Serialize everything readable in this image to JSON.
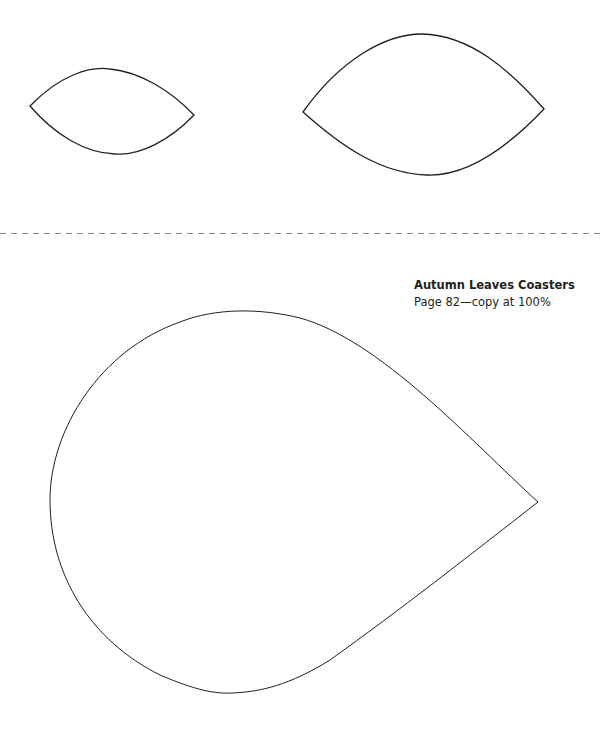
{
  "document": {
    "title": "Autumn Leaves Coasters",
    "subtitle": "Page 82—copy at 100%",
    "stroke_color": "#231f20",
    "cut_line_color": "#8a8a8a",
    "templates": [
      {
        "id": "small-leaf",
        "kind": "leaf"
      },
      {
        "id": "large-leaf",
        "kind": "leaf"
      },
      {
        "id": "teardrop",
        "kind": "teardrop"
      }
    ]
  }
}
